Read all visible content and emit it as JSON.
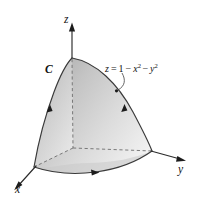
{
  "figure": {
    "background_color": "#ffffff",
    "surface": {
      "name": "paraboloid-surface",
      "equation_label": {
        "z_var": "z",
        "equals": "=",
        "one": "1",
        "minus_1": "−",
        "x_var": "x",
        "x_exp": "2",
        "minus_2": "−",
        "y_var": "y",
        "y_exp": "2",
        "full_text": "z = 1 − x² − y²"
      },
      "fill_light": "#f2f2f2",
      "fill_mid": "#d3d3d3",
      "fill_dark": "#a9a9a9",
      "edge_color": "#3a3a3a"
    },
    "curve": {
      "name": "boundary-curve-c",
      "label": "C",
      "orientation": "counterclockwise viewed from above",
      "arrow_count": 3
    },
    "axes": [
      {
        "id": "x",
        "label": "x",
        "direction": "lower-left"
      },
      {
        "id": "y",
        "label": "y",
        "direction": "right"
      },
      {
        "id": "z",
        "label": "z",
        "direction": "up"
      }
    ],
    "origin": {
      "x": 73,
      "y": 148
    },
    "apex": {
      "x": 72,
      "y": 58
    },
    "dimensions": {
      "width": 199,
      "height": 206
    }
  }
}
